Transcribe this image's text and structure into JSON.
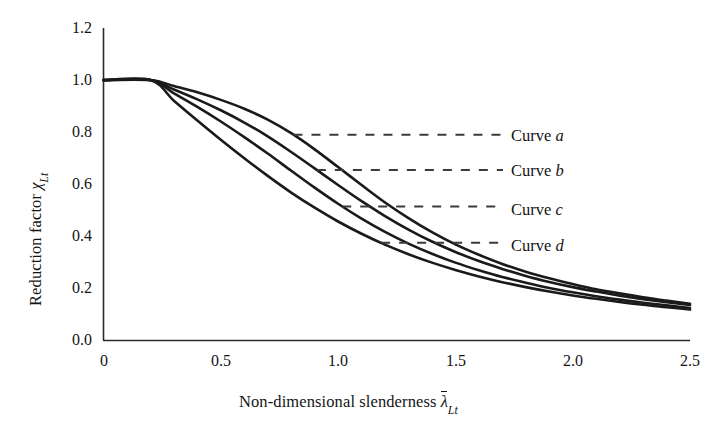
{
  "figure": {
    "background": "#ffffff",
    "line_color": "#1a1a1a",
    "width": 721,
    "height": 437
  },
  "axis": {
    "y_title_prefix": "Reduction factor ",
    "y_title_symbol": "χ",
    "y_title_sub": "Lt",
    "x_title_prefix": "Non-dimensional slenderness ",
    "x_title_symbol": "λ",
    "x_title_sub": "Lt",
    "y_ticks": [
      "0.0",
      "0.2",
      "0.4",
      "0.6",
      "0.8",
      "1.0",
      "1.2"
    ],
    "x_ticks": [
      "0",
      "0.5",
      "1.0",
      "1.5",
      "2.0",
      "2.5"
    ]
  },
  "legend": {
    "items": [
      {
        "label_prefix": "Curve ",
        "label_letter": "a"
      },
      {
        "label_prefix": "Curve ",
        "label_letter": "b"
      },
      {
        "label_prefix": "Curve ",
        "label_letter": "c"
      },
      {
        "label_prefix": "Curve ",
        "label_letter": "d"
      }
    ]
  },
  "chart_data": {
    "type": "line",
    "title": "",
    "xlabel": "Non-dimensional slenderness λ̄_Lt",
    "ylabel": "Reduction factor χ_Lt",
    "xlim": [
      0,
      2.5
    ],
    "ylim": [
      0.0,
      1.2
    ],
    "xticks": [
      0,
      0.5,
      1.0,
      1.5,
      2.0,
      2.5
    ],
    "yticks": [
      0.0,
      0.2,
      0.4,
      0.6,
      0.8,
      1.0,
      1.2
    ],
    "grid": false,
    "legend_position": "right-inside",
    "x": [
      0.0,
      0.2,
      0.3,
      0.4,
      0.5,
      0.6,
      0.7,
      0.8,
      0.9,
      1.0,
      1.1,
      1.2,
      1.3,
      1.4,
      1.5,
      1.6,
      1.7,
      1.8,
      1.9,
      2.0,
      2.1,
      2.2,
      2.3,
      2.4,
      2.5
    ],
    "series": [
      {
        "name": "Curve a",
        "alpha": 0.21,
        "leader_y": 0.79,
        "values": [
          1.0,
          1.0,
          0.977,
          0.953,
          0.924,
          0.89,
          0.848,
          0.796,
          0.734,
          0.666,
          0.597,
          0.53,
          0.47,
          0.416,
          0.369,
          0.329,
          0.294,
          0.264,
          0.239,
          0.217,
          0.197,
          0.181,
          0.166,
          0.153,
          0.141
        ]
      },
      {
        "name": "Curve b",
        "alpha": 0.34,
        "leader_y": 0.655,
        "values": [
          1.0,
          1.0,
          0.964,
          0.926,
          0.884,
          0.837,
          0.784,
          0.724,
          0.661,
          0.597,
          0.535,
          0.478,
          0.426,
          0.38,
          0.34,
          0.305,
          0.275,
          0.248,
          0.225,
          0.205,
          0.188,
          0.172,
          0.159,
          0.147,
          0.136
        ]
      },
      {
        "name": "Curve c",
        "alpha": 0.49,
        "leader_y": 0.515,
        "values": [
          1.0,
          1.0,
          0.949,
          0.897,
          0.841,
          0.781,
          0.718,
          0.652,
          0.587,
          0.525,
          0.468,
          0.417,
          0.372,
          0.333,
          0.299,
          0.27,
          0.244,
          0.222,
          0.202,
          0.185,
          0.17,
          0.157,
          0.145,
          0.135,
          0.125
        ]
      },
      {
        "name": "Curve d",
        "alpha": 0.76,
        "leader_y": 0.375,
        "values": [
          1.0,
          1.0,
          0.921,
          0.845,
          0.771,
          0.7,
          0.632,
          0.568,
          0.51,
          0.457,
          0.41,
          0.368,
          0.331,
          0.299,
          0.271,
          0.246,
          0.224,
          0.205,
          0.188,
          0.173,
          0.16,
          0.148,
          0.137,
          0.128,
          0.119
        ]
      }
    ]
  }
}
